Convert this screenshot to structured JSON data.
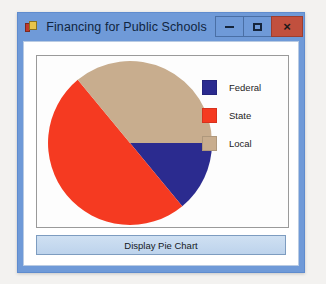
{
  "window": {
    "title": "Financing for Public Schools",
    "icon_name": "application-icon",
    "controls": {
      "minimize_label": "–",
      "maximize_label": "□",
      "close_label": "×"
    },
    "accent_color": "#6f9ad8",
    "close_color": "#c1503e"
  },
  "main": {
    "button": {
      "label": "Display Pie Chart"
    }
  },
  "chart_data": {
    "type": "pie",
    "title": "",
    "categories": [
      "Federal",
      "State",
      "Local"
    ],
    "values": [
      14,
      50,
      36
    ],
    "colors": [
      "#2b2b8f",
      "#f53a21",
      "#c8ad8e"
    ],
    "legend_position": "right",
    "start_angle_deg": 0,
    "direction": "clockwise",
    "legend": [
      {
        "label": "Federal",
        "color": "#2b2b8f",
        "value": 14
      },
      {
        "label": "State",
        "color": "#f53a21",
        "value": 50
      },
      {
        "label": "Local",
        "color": "#c8ad8e",
        "value": 36
      }
    ]
  }
}
